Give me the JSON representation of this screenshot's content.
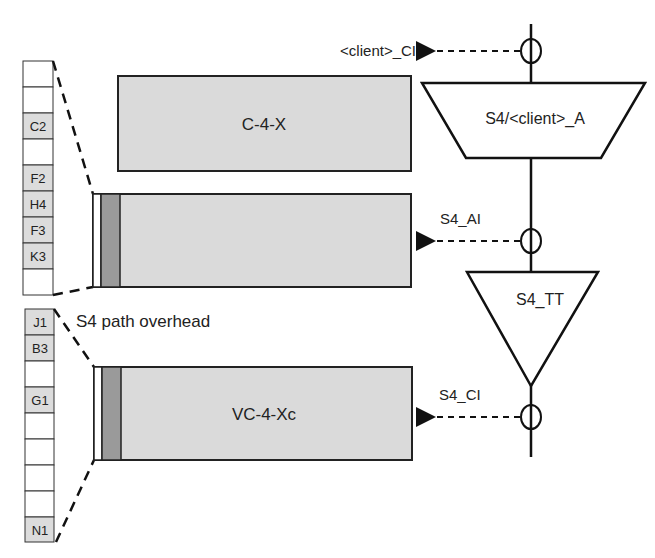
{
  "colors": {
    "filled_cell": "#dcdcdc",
    "empty_cell": "#ffffff",
    "payload_fill": "#dadada",
    "overhead_column": "#9a9a9a",
    "line": "#111111"
  },
  "upper_column": {
    "cells": [
      "",
      "",
      "C2",
      "",
      "F2",
      "H4",
      "F3",
      "K3",
      ""
    ]
  },
  "lower_column": {
    "cells": [
      "J1",
      "B3",
      "",
      "G1",
      "",
      "",
      "",
      "",
      "N1"
    ]
  },
  "boxes": {
    "c4x": "C-4-X",
    "middle": "",
    "vc4xc": "VC-4-Xc"
  },
  "labels": {
    "path_overhead": "S4 path overhead"
  },
  "functions": {
    "adaptation": "S4/<client>_A",
    "trail_termination": "S4_TT"
  },
  "signals": {
    "client_ci": "<client>_CI",
    "s4_ai": "S4_AI",
    "s4_ci": "S4_CI"
  }
}
